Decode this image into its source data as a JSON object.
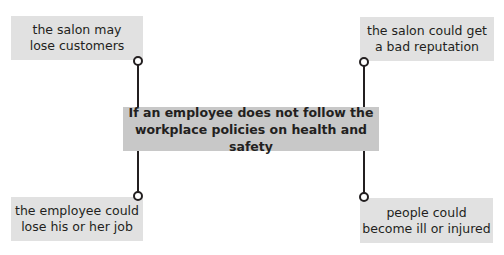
{
  "diagram": {
    "center": {
      "line1": "If an employee does not follow the",
      "line2": "workplace policies on health and safety"
    },
    "consequences": [
      {
        "position": "top-left",
        "line1": "the salon may",
        "line2": "lose customers"
      },
      {
        "position": "top-right",
        "line1": "the salon could get",
        "line2": "a bad reputation"
      },
      {
        "position": "bottom-left",
        "line1": "the employee could",
        "line2": "lose his or her job"
      },
      {
        "position": "bottom-right",
        "line1": "people could",
        "line2": "become ill or injured"
      }
    ],
    "colors": {
      "outer_box": "#e1e1e1",
      "center_box": "#c8c8c8",
      "line": "#231f20"
    }
  }
}
